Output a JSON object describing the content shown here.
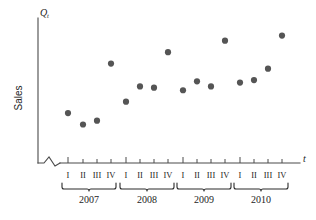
{
  "chart_data": {
    "type": "scatter",
    "title": "",
    "xlabel": "t",
    "ylabel": "Sales",
    "y_axis_symbol": "Q",
    "y_axis_symbol_sub": "t",
    "x_axis_symbol": "t",
    "grid": false,
    "legend": "none",
    "axis_break": true,
    "x_tick_labels": [
      "I",
      "II",
      "III",
      "IV",
      "I",
      "II",
      "III",
      "IV",
      "I",
      "II",
      "III",
      "IV",
      "I",
      "II",
      "III",
      "IV"
    ],
    "group_labels": [
      "2007",
      "2008",
      "2009",
      "2010"
    ],
    "categories": [
      "2007 I",
      "2007 II",
      "2007 III",
      "2007 IV",
      "2008 I",
      "2008 II",
      "2008 III",
      "2008 IV",
      "2009 I",
      "2009 II",
      "2009 III",
      "2009 IV",
      "2010 I",
      "2010 II",
      "2010 III",
      "2010 IV"
    ],
    "values": [
      33,
      24,
      27,
      72,
      42,
      54,
      53,
      81,
      51,
      58,
      54,
      90,
      57,
      59,
      68,
      94
    ],
    "ylim": [
      0,
      100
    ],
    "point_color": "#555555",
    "axis_color": "#4a4a4a"
  },
  "labels": {
    "y_symbol": "Q",
    "y_symbol_sub": "t",
    "x_symbol": "t",
    "y_axis_name": "Sales"
  },
  "quarters": [
    "I",
    "II",
    "III",
    "IV"
  ],
  "years": [
    "2007",
    "2008",
    "2009",
    "2010"
  ]
}
